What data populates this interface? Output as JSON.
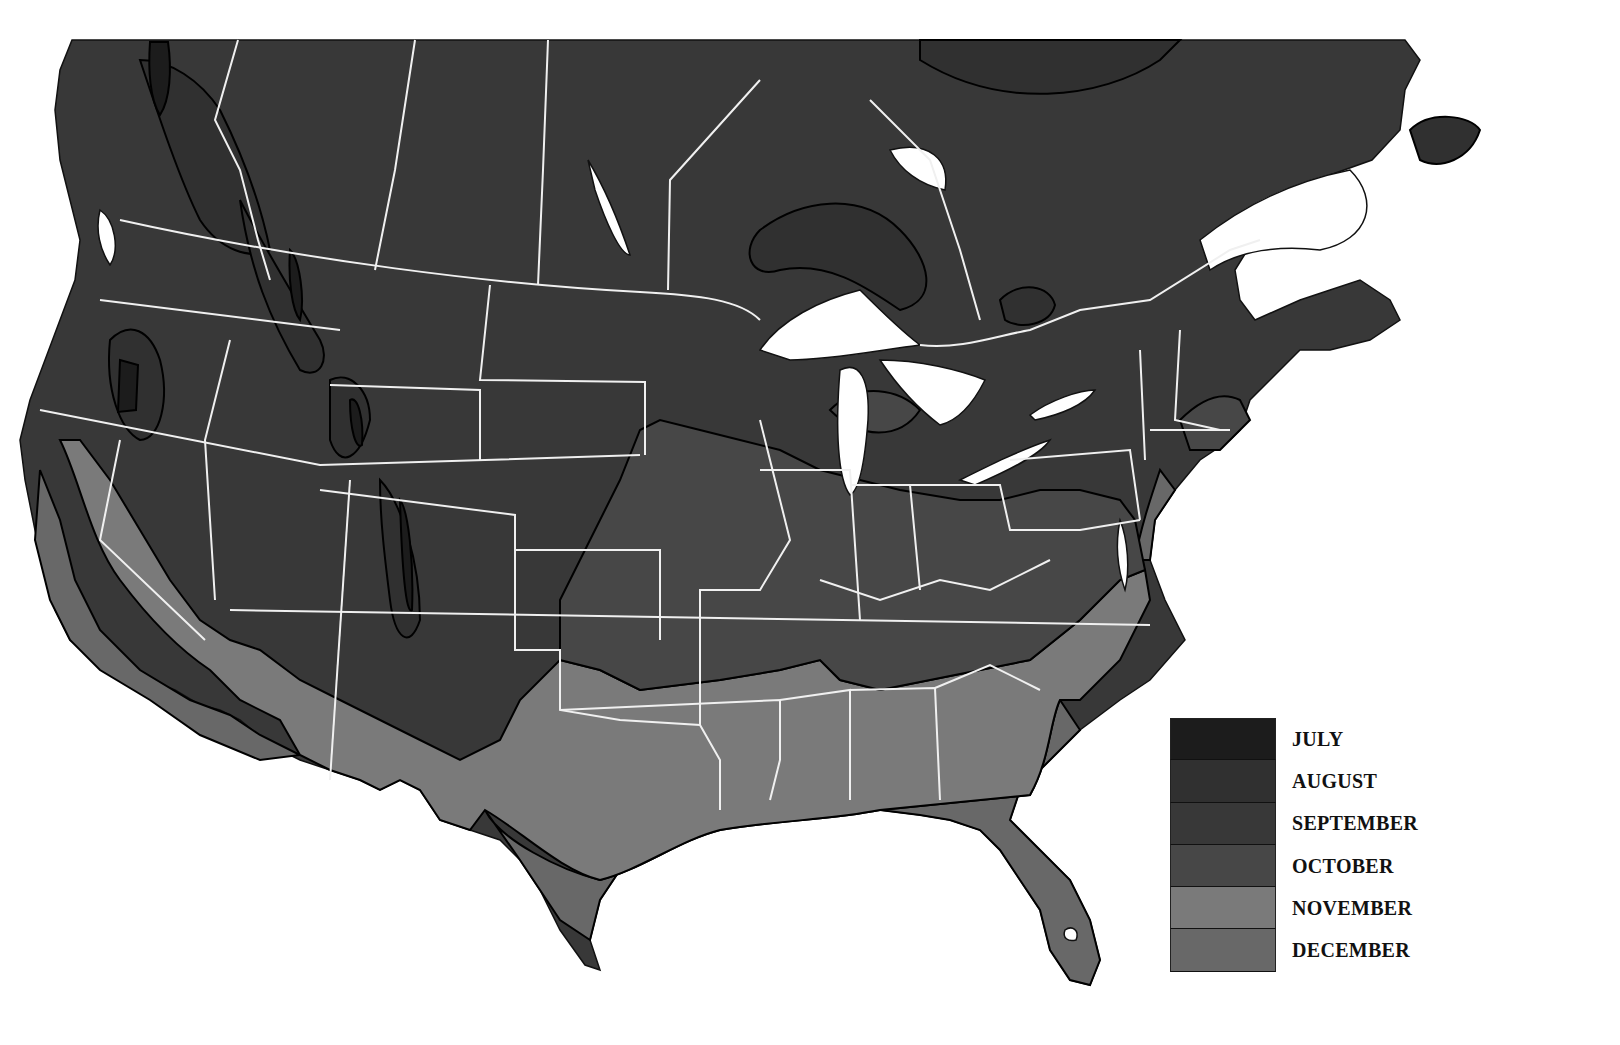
{
  "map": {
    "subject": "First frost month across North America",
    "region": "North America (Canada and contiguous United States)",
    "water_color": "#ffffff",
    "border_color": "#f0f0f0",
    "contour_color": "#000000"
  },
  "legend": {
    "items": [
      {
        "label": "JULY",
        "color": "#1c1c1c"
      },
      {
        "label": "AUGUST",
        "color": "#303030"
      },
      {
        "label": "SEPTEMBER",
        "color": "#383838"
      },
      {
        "label": "OCTOBER",
        "color": "#474747"
      },
      {
        "label": "NOVEMBER",
        "color": "#7a7a7a"
      },
      {
        "label": "DECEMBER",
        "color": "#686868"
      }
    ]
  }
}
